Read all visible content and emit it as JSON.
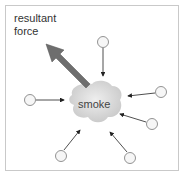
{
  "diagram": {
    "resultant_label_line1": "resultant",
    "resultant_label_line2": "force",
    "center_label": "smoke",
    "colors": {
      "arrow_fill": "#6e6e6e",
      "smoke_fill": "#d4d4d4",
      "particle_stroke": "#666666",
      "frame": "#c9c9c9"
    },
    "particles": [
      {
        "cx": 103,
        "cy": 42
      },
      {
        "cx": 30,
        "cy": 100
      },
      {
        "cx": 161,
        "cy": 92
      },
      {
        "cx": 152,
        "cy": 124
      },
      {
        "cx": 61,
        "cy": 156
      },
      {
        "cx": 130,
        "cy": 158
      }
    ]
  }
}
